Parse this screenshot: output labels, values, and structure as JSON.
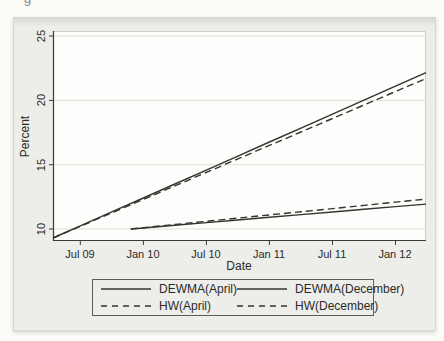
{
  "figure": {
    "cropped_caption_fragment": "g"
  },
  "chart_data": {
    "type": "line",
    "title": "",
    "xlabel": "Date",
    "ylabel": "Percent",
    "x_unit": "months since Apr 2009",
    "xlim": [
      0.4,
      35.9
    ],
    "ylim": [
      9.07,
      25.39
    ],
    "grid": "horizontal",
    "legend_position": "bottom",
    "line_color": "#333330",
    "xticks": [
      {
        "t": 3,
        "label": "Jul 09"
      },
      {
        "t": 9,
        "label": "Jan 10"
      },
      {
        "t": 15,
        "label": "Jul 10"
      },
      {
        "t": 21,
        "label": "Jan 11"
      },
      {
        "t": 27,
        "label": "Jul 11"
      },
      {
        "t": 33,
        "label": "Jan 12"
      }
    ],
    "yticks": [
      {
        "v": 25,
        "label": "25"
      },
      {
        "v": 20,
        "label": "20"
      },
      {
        "v": 15,
        "label": "15"
      },
      {
        "v": 10,
        "label": "10"
      }
    ],
    "series": [
      {
        "name": "DEWMA(April)",
        "style": "solid",
        "color": "#333330",
        "points": [
          [
            0.4,
            9.3
          ],
          [
            3,
            10.24
          ],
          [
            6,
            11.33
          ],
          [
            9,
            12.41
          ],
          [
            12,
            13.5
          ],
          [
            15,
            14.58
          ],
          [
            18,
            15.67
          ],
          [
            21,
            16.76
          ],
          [
            24,
            17.84
          ],
          [
            27,
            18.93
          ],
          [
            30,
            20.01
          ],
          [
            33,
            21.1
          ],
          [
            35.9,
            22.15
          ]
        ]
      },
      {
        "name": "HW(April)",
        "style": "dashed",
        "color": "#333330",
        "points": [
          [
            0.4,
            9.3
          ],
          [
            3,
            10.21
          ],
          [
            6,
            11.26
          ],
          [
            9,
            12.3
          ],
          [
            12,
            13.35
          ],
          [
            15,
            14.4
          ],
          [
            18,
            15.45
          ],
          [
            21,
            16.5
          ],
          [
            24,
            17.54
          ],
          [
            27,
            18.59
          ],
          [
            30,
            19.64
          ],
          [
            33,
            20.69
          ],
          [
            35.9,
            21.7
          ]
        ]
      },
      {
        "name": "DEWMA(December)",
        "style": "solid",
        "color": "#333330",
        "points": [
          [
            7.8,
            10.0
          ],
          [
            9,
            10.08
          ],
          [
            12,
            10.29
          ],
          [
            15,
            10.5
          ],
          [
            18,
            10.7
          ],
          [
            21,
            10.91
          ],
          [
            24,
            11.12
          ],
          [
            27,
            11.32
          ],
          [
            30,
            11.53
          ],
          [
            33,
            11.74
          ],
          [
            35.9,
            11.94
          ]
        ]
      },
      {
        "name": "HW(December)",
        "style": "dashed",
        "color": "#333330",
        "points": [
          [
            7.8,
            10.0
          ],
          [
            9,
            10.1
          ],
          [
            12,
            10.35
          ],
          [
            15,
            10.6
          ],
          [
            18,
            10.85
          ],
          [
            21,
            11.1
          ],
          [
            24,
            11.34
          ],
          [
            27,
            11.59
          ],
          [
            30,
            11.84
          ],
          [
            33,
            12.09
          ],
          [
            35.9,
            12.33
          ]
        ]
      }
    ]
  }
}
